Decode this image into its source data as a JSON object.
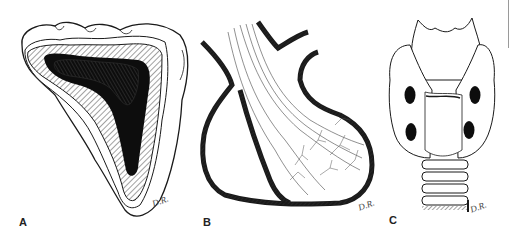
{
  "figure": {
    "panels": [
      {
        "id": "A",
        "label": "A",
        "signature": "D.R.",
        "subject": "cross-section-lobe"
      },
      {
        "id": "B",
        "label": "B",
        "signature": "D.R.",
        "subject": "vessel-sac-with-branching-fibers"
      },
      {
        "id": "C",
        "label": "C",
        "signature": "D.R.",
        "subject": "thyroid-larynx-trachea-anterior-view"
      }
    ],
    "colors": {
      "ink": "#1a1a1a",
      "hatch": "#555555",
      "background": "#ffffff",
      "edge_line": "#9a9a9a"
    }
  }
}
